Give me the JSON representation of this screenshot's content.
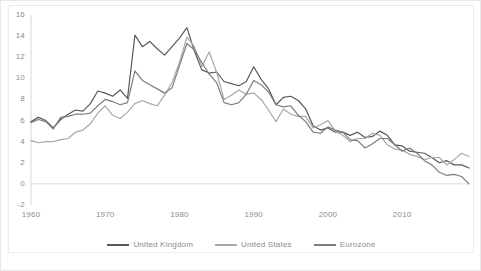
{
  "chart_data": {
    "type": "line",
    "title": "",
    "subtitle": "",
    "xlabel": "",
    "ylabel": "",
    "xlim": [
      1960,
      2019
    ],
    "ylim": [
      -2,
      16
    ],
    "grid": false,
    "legend_position": "bottom",
    "x_ticks": [
      "1960",
      "1970",
      "1980",
      "1990",
      "2000",
      "2010"
    ],
    "x_tick_values": [
      1960,
      1970,
      1980,
      1990,
      2000,
      2010
    ],
    "y_ticks": [
      "-2",
      "0",
      "2",
      "4",
      "6",
      "8",
      "10",
      "12",
      "14",
      "16"
    ],
    "y_tick_values": [
      -2,
      0,
      2,
      4,
      6,
      8,
      10,
      12,
      14,
      16
    ],
    "x": [
      1960,
      1961,
      1962,
      1963,
      1964,
      1965,
      1966,
      1967,
      1968,
      1969,
      1970,
      1971,
      1972,
      1973,
      1974,
      1975,
      1976,
      1977,
      1978,
      1979,
      1980,
      1981,
      1982,
      1983,
      1984,
      1985,
      1986,
      1987,
      1988,
      1989,
      1990,
      1991,
      1992,
      1993,
      1994,
      1995,
      1996,
      1997,
      1998,
      1999,
      2000,
      2001,
      2002,
      2003,
      2004,
      2005,
      2006,
      2007,
      2008,
      2009,
      2010,
      2011,
      2012,
      2013,
      2014,
      2015,
      2016,
      2017,
      2018,
      2019
    ],
    "series": [
      {
        "name": "United Kingdom",
        "color": "#595959",
        "values": [
          5.9,
          6.3,
          6.0,
          5.3,
          6.1,
          6.6,
          7.0,
          6.9,
          7.6,
          8.8,
          8.6,
          8.3,
          8.9,
          8.1,
          14.1,
          13.0,
          13.5,
          12.8,
          12.2,
          13.0,
          13.8,
          14.8,
          12.6,
          10.8,
          10.5,
          10.6,
          9.7,
          9.5,
          9.3,
          9.7,
          11.1,
          9.9,
          9.0,
          7.5,
          8.2,
          8.3,
          7.9,
          7.1,
          5.5,
          5.1,
          5.3,
          4.9,
          4.9,
          4.6,
          4.9,
          4.4,
          4.5,
          5.0,
          4.6,
          3.7,
          3.6,
          3.1,
          3.0,
          2.9,
          2.5,
          2.0,
          2.2,
          1.8,
          1.8,
          1.5
        ]
      },
      {
        "name": "United States",
        "color": "#a8a8a8",
        "values": [
          4.1,
          3.9,
          4.0,
          4.0,
          4.2,
          4.3,
          4.9,
          5.1,
          5.7,
          6.7,
          7.4,
          6.5,
          6.2,
          6.8,
          7.6,
          7.9,
          7.6,
          7.4,
          8.4,
          9.6,
          11.5,
          13.9,
          13.0,
          11.1,
          12.5,
          10.6,
          8.0,
          8.4,
          8.9,
          8.5,
          8.6,
          8.0,
          7.0,
          5.9,
          7.1,
          6.6,
          6.4,
          6.4,
          5.3,
          5.6,
          6.0,
          5.0,
          4.6,
          4.0,
          4.3,
          4.3,
          4.8,
          4.6,
          3.7,
          3.3,
          3.2,
          2.8,
          2.6,
          2.3,
          2.5,
          2.5,
          1.8,
          2.3,
          2.9,
          2.6
        ]
      },
      {
        "name": "Eurozone",
        "color": "#7d7d7d",
        "values": [
          5.8,
          6.1,
          5.9,
          5.2,
          6.3,
          6.4,
          6.6,
          6.6,
          6.7,
          7.4,
          8.0,
          7.8,
          7.5,
          7.7,
          10.7,
          9.8,
          9.4,
          9.0,
          8.6,
          9.1,
          11.2,
          13.3,
          12.7,
          11.5,
          10.4,
          9.6,
          7.7,
          7.5,
          7.7,
          8.5,
          9.8,
          9.4,
          8.7,
          7.5,
          7.3,
          7.4,
          6.5,
          5.9,
          4.9,
          4.8,
          5.4,
          5.1,
          4.9,
          4.2,
          4.1,
          3.4,
          3.8,
          4.3,
          4.3,
          3.7,
          3.1,
          3.4,
          2.9,
          2.2,
          1.8,
          1.1,
          0.8,
          0.9,
          0.7,
          0.0
        ]
      }
    ]
  },
  "axis": {
    "y_labels": [
      "16",
      "14",
      "12",
      "10",
      "8",
      "6",
      "4",
      "2",
      "0",
      "-2"
    ],
    "x_labels": [
      "1960",
      "1970",
      "1980",
      "1990",
      "2000",
      "2010"
    ]
  },
  "legend": {
    "items": [
      {
        "label": "United Kingdom",
        "color": "#595959"
      },
      {
        "label": "United States",
        "color": "#a8a8a8"
      },
      {
        "label": "Eurozone",
        "color": "#7d7d7d"
      }
    ]
  }
}
